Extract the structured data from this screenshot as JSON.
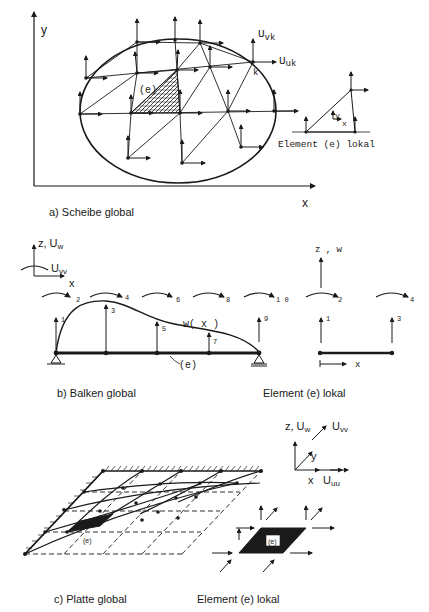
{
  "figure": {
    "panel_a": {
      "caption": "a)   Scheibe global",
      "axis_y": "y",
      "axis_x": "x",
      "element_label": "(e)",
      "node_label": "k",
      "dof_v": "U",
      "dof_v_sub": "vk",
      "dof_u": "U",
      "dof_u_sub": "uk",
      "local": {
        "caption": "Element (e) lokal",
        "axis_y": "y",
        "axis_x": "x"
      }
    },
    "panel_b": {
      "caption": "b) Balken global",
      "axis_z": "z, U",
      "axis_z_sub": "w",
      "rot": "U",
      "rot_sub": "vv",
      "axis_x": "x",
      "curve_label": "w( x )",
      "element_label": "(e)",
      "dofs_rot": [
        "2",
        "4",
        "6",
        "8",
        "1 0"
      ],
      "dofs_trans": [
        "1",
        "3",
        "5",
        "7",
        "9"
      ],
      "local": {
        "caption": "Element  (e)  lokal",
        "axis_z": "z , w",
        "axis_x": "x",
        "dofs_rot": [
          "2",
          "4"
        ],
        "dofs_trans": [
          "1",
          "3"
        ]
      }
    },
    "panel_c": {
      "caption": "c)   Platte global",
      "element_label": "(e)",
      "axes": {
        "z": "z, U",
        "z_sub": "w",
        "v": "U",
        "v_sub": "vv",
        "y": "y",
        "x": "x",
        "u": "U",
        "u_sub": "uu"
      },
      "local": {
        "caption": "Element  (e)  lokal",
        "element_label": "(e)"
      }
    }
  }
}
